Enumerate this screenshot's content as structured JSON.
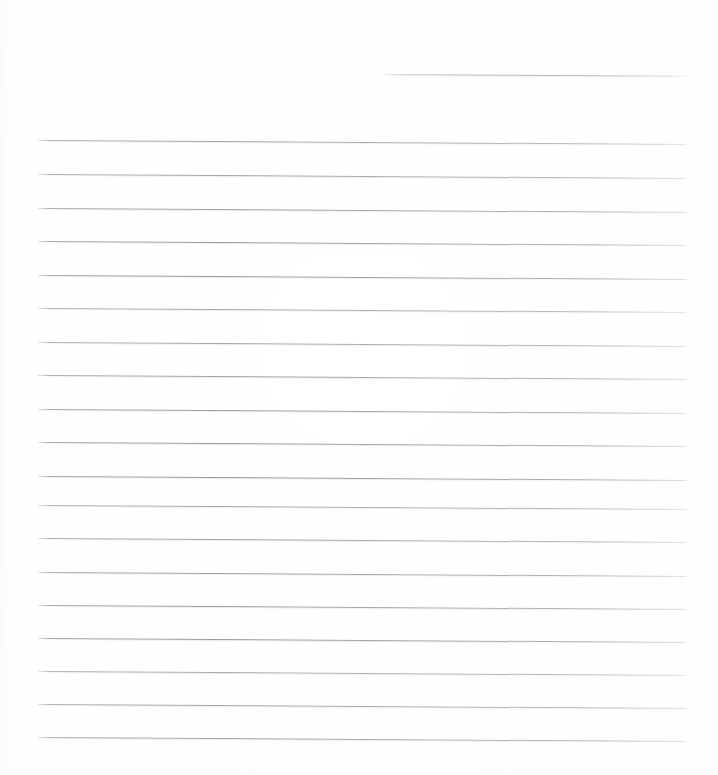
{
  "document": {
    "kind": "scanned-lined-paper",
    "title": "Blank Ruled Notebook Page",
    "page_width": 718,
    "page_height": 775,
    "background_color": "#fefefe",
    "rule_color": "#9a9aa2",
    "content_text": "",
    "notes": "No handwriting, no printed text, no margin rule — the page is empty."
  },
  "ruling": {
    "line_count": 19,
    "spacing_px": 33.4,
    "full_line_start_x": 38,
    "line_end_x": 688,
    "first_line_y": 74,
    "last_line_y": 737,
    "tilt_degrees": 0.35,
    "lines": [
      {
        "y": 74,
        "x": 383,
        "width": 305,
        "variant": "short"
      },
      {
        "y": 140,
        "x": 38,
        "width": 650,
        "variant": "full"
      },
      {
        "y": 174,
        "x": 38,
        "width": 650,
        "variant": "full"
      },
      {
        "y": 208,
        "x": 38,
        "width": 650,
        "variant": "full"
      },
      {
        "y": 241,
        "x": 38,
        "width": 650,
        "variant": "full"
      },
      {
        "y": 275,
        "x": 38,
        "width": 650,
        "variant": "full"
      },
      {
        "y": 308,
        "x": 38,
        "width": 650,
        "variant": "full"
      },
      {
        "y": 342,
        "x": 38,
        "width": 650,
        "variant": "full"
      },
      {
        "y": 375,
        "x": 38,
        "width": 650,
        "variant": "full"
      },
      {
        "y": 409,
        "x": 38,
        "width": 650,
        "variant": "full"
      },
      {
        "y": 442,
        "x": 38,
        "width": 650,
        "variant": "full"
      },
      {
        "y": 476,
        "x": 38,
        "width": 650,
        "variant": "full"
      },
      {
        "y": 505,
        "x": 38,
        "width": 650,
        "variant": "full"
      },
      {
        "y": 538,
        "x": 38,
        "width": 650,
        "variant": "full"
      },
      {
        "y": 572,
        "x": 38,
        "width": 650,
        "variant": "full"
      },
      {
        "y": 605,
        "x": 38,
        "width": 650,
        "variant": "full"
      },
      {
        "y": 638,
        "x": 38,
        "width": 650,
        "variant": "full"
      },
      {
        "y": 671,
        "x": 38,
        "width": 650,
        "variant": "full"
      },
      {
        "y": 704,
        "x": 38,
        "width": 650,
        "variant": "full"
      },
      {
        "y": 737,
        "x": 38,
        "width": 650,
        "variant": "full"
      }
    ]
  }
}
